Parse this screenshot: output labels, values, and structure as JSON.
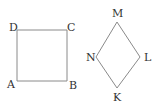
{
  "square": {
    "vertices": {
      "D": {
        "label": "D",
        "x": 17,
        "y": 30
      },
      "C": {
        "label": "C",
        "x": 67,
        "y": 30
      },
      "B": {
        "label": "B",
        "x": 67,
        "y": 81
      },
      "A": {
        "label": "A",
        "x": 17,
        "y": 81
      }
    }
  },
  "rhombus": {
    "vertices": {
      "M": {
        "label": "M",
        "x": 117,
        "y": 22
      },
      "L": {
        "label": "L",
        "x": 140,
        "y": 57
      },
      "K": {
        "label": "K",
        "x": 117,
        "y": 88
      },
      "N": {
        "label": "N",
        "x": 96,
        "y": 57
      }
    }
  },
  "colors": {
    "stroke": "#8a8a8a",
    "text": "#333333",
    "background": "#ffffff"
  }
}
